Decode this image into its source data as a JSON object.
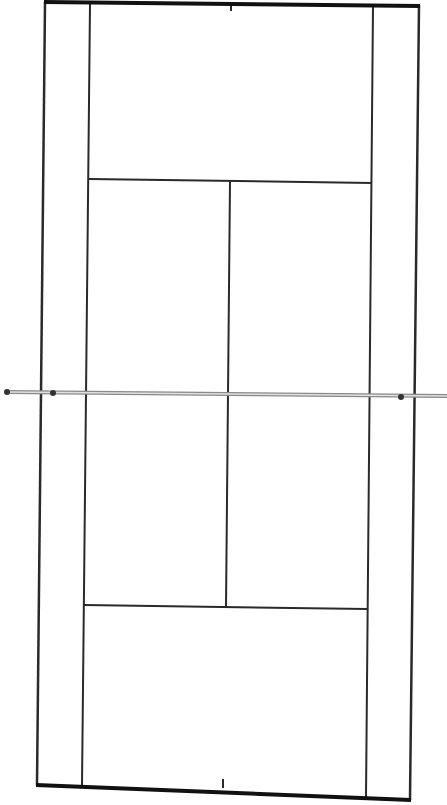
{
  "diagram": {
    "type": "tennis-court-line-diagram",
    "orientation": "vertical",
    "colors": {
      "background": "#ffffff",
      "lines": "#2a2a2a",
      "baseline": "#111111",
      "net": "#9a9a9a",
      "net_posts": "#333333"
    },
    "labels": []
  }
}
